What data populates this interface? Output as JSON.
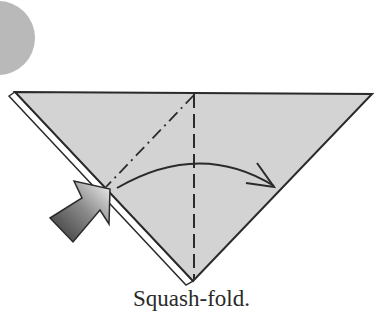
{
  "diagram": {
    "type": "origami-step",
    "caption": "Squash-fold.",
    "colors": {
      "paper": "#d3d3d3",
      "line": "#2a2a2a",
      "step_circle": "#b9b9b9",
      "arrow_dark": "#3a3a3a",
      "arrow_light": "#f0f0f0"
    },
    "elements": [
      {
        "name": "step-circle",
        "kind": "decorative circle (partially visible)"
      },
      {
        "name": "paper-triangle",
        "kind": "inverted triangle, folded paper"
      },
      {
        "name": "valley-fold-line",
        "kind": "vertical dashed line"
      },
      {
        "name": "mountain-fold-line",
        "kind": "dash-dot diagonal line"
      },
      {
        "name": "fold-direction-arrow",
        "kind": "curved arrow left to right"
      },
      {
        "name": "push-arrow",
        "kind": "gradient push/squash arrow"
      }
    ]
  }
}
